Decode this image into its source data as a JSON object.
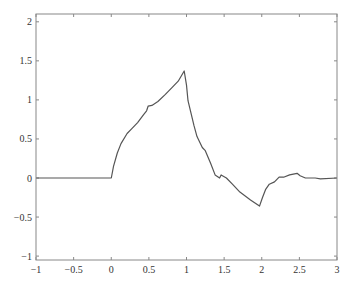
{
  "chart_data": {
    "type": "line",
    "title": "",
    "xlabel": "",
    "ylabel": "",
    "xlim": [
      -1,
      3
    ],
    "ylim": [
      -1.05,
      2.1
    ],
    "grid": false,
    "legend": null,
    "x_ticks": [
      -1,
      -0.5,
      0,
      0.5,
      1,
      1.5,
      2,
      2.5,
      3
    ],
    "x_tick_labels": [
      "−1",
      "−0.5",
      "0",
      "0.5",
      "1",
      "1.5",
      "2",
      "2.5",
      "3"
    ],
    "y_ticks": [
      -1,
      -0.5,
      0,
      0.5,
      1,
      1.5,
      2
    ],
    "y_tick_labels": [
      "−1",
      "−0.5",
      "0",
      "0.5",
      "1",
      "1.5",
      "2"
    ],
    "line_color": "#555555",
    "series": [
      {
        "name": "signal",
        "x": [
          -1,
          0,
          0.03,
          0.08,
          0.13,
          0.21,
          0.27,
          0.35,
          0.43,
          0.47,
          0.49,
          0.54,
          0.62,
          0.72,
          0.81,
          0.89,
          0.97,
          1.0,
          1.02,
          1.06,
          1.1,
          1.14,
          1.21,
          1.25,
          1.32,
          1.38,
          1.44,
          1.46,
          1.53,
          1.61,
          1.71,
          1.85,
          1.97,
          2.01,
          2.05,
          2.1,
          2.17,
          2.23,
          2.29,
          2.37,
          2.47,
          2.51,
          2.58,
          2.71,
          2.78,
          3.0
        ],
        "y": [
          0,
          0,
          0.15,
          0.32,
          0.44,
          0.57,
          0.63,
          0.71,
          0.81,
          0.86,
          0.92,
          0.93,
          0.98,
          1.07,
          1.16,
          1.24,
          1.37,
          1.19,
          0.99,
          0.83,
          0.67,
          0.53,
          0.39,
          0.35,
          0.19,
          0.04,
          0.0,
          0.04,
          0.0,
          -0.08,
          -0.18,
          -0.28,
          -0.36,
          -0.25,
          -0.15,
          -0.08,
          -0.05,
          0.01,
          0.01,
          0.04,
          0.06,
          0.03,
          0.0,
          0.0,
          -0.01,
          0.0
        ]
      }
    ]
  },
  "plot_area": {
    "left": 36,
    "top": 14,
    "right": 337,
    "bottom": 260
  }
}
